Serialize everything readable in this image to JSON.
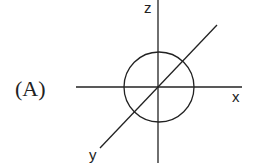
{
  "figure": {
    "option_label": "(A)",
    "axes": {
      "x_label": "x",
      "y_label": "y",
      "z_label": "z"
    },
    "shape": "circle",
    "stroke_color": "#222222",
    "background": "#ffffff"
  }
}
